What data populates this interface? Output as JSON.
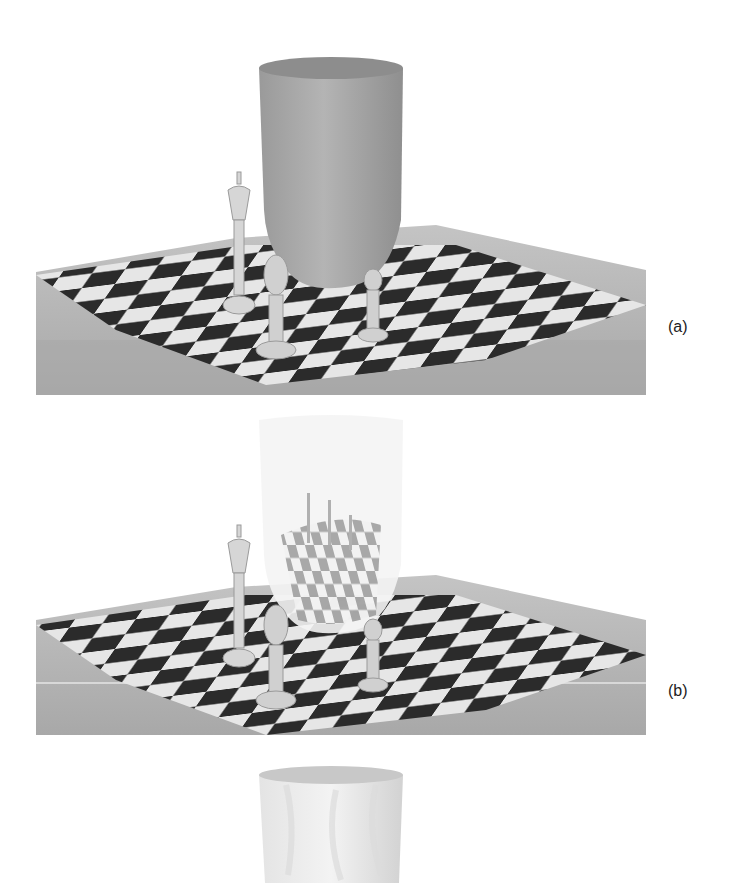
{
  "figure": {
    "panels": [
      {
        "id": "a",
        "label": "(a)",
        "description": "Opaque vase standing on chessboard with king, knight/bishop and pawn pieces"
      },
      {
        "id": "b",
        "label": "(b)",
        "description": "Transparent vase showing refracted, distorted chessboard and pieces"
      },
      {
        "id": "c",
        "label": "",
        "description": "Textured vase (partially visible, cropped at bottom)"
      }
    ]
  },
  "colors": {
    "background": "#ffffff",
    "table": "#b9b9b9",
    "table_side": "#a8a8a8",
    "dark_square": "#2a2a2a",
    "light_square": "#e8e8e8",
    "vase": "#a9a9a9",
    "piece": "#d8d8d8"
  }
}
